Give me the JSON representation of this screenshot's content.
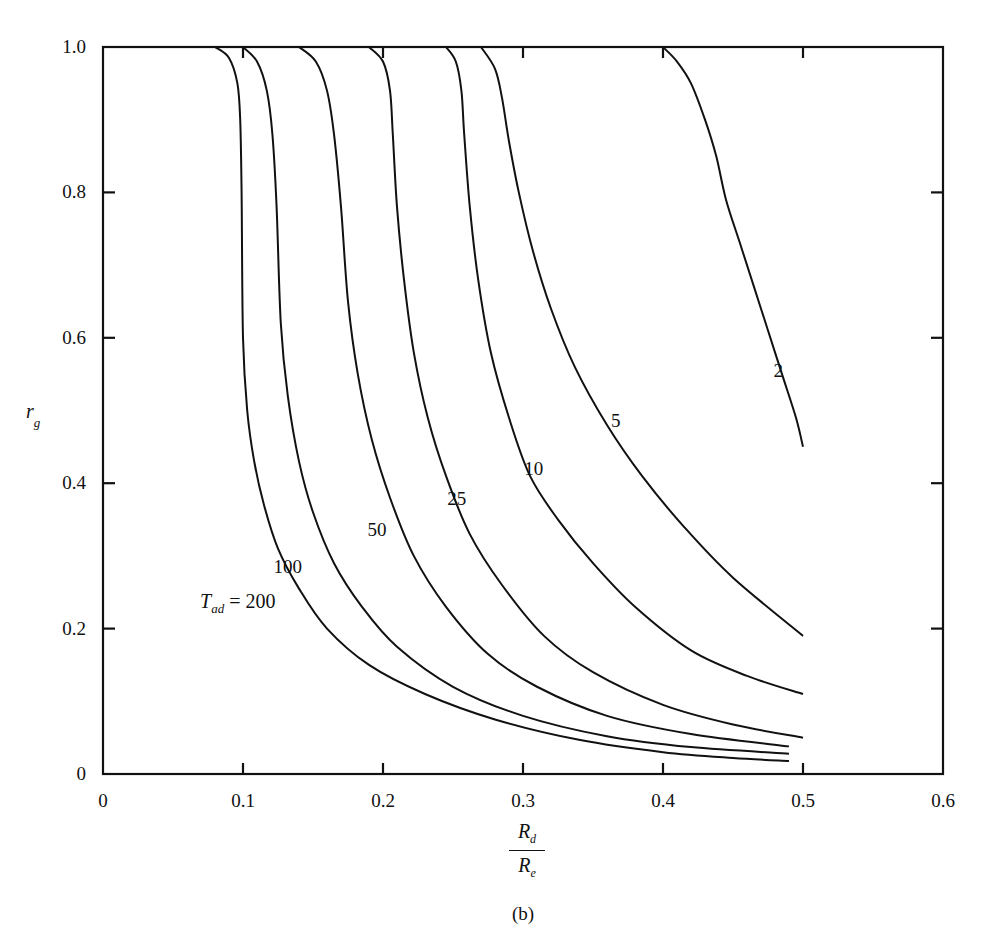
{
  "chart_data": {
    "type": "line",
    "title": "",
    "caption": "(b)",
    "xlabel": "R_d / R_e",
    "xlabel_num": "R",
    "xlabel_num_sub": "d",
    "xlabel_den": "R",
    "xlabel_den_sub": "e",
    "ylabel": "r_g",
    "ylabel_main": "r",
    "ylabel_sub": "g",
    "xlim": [
      0,
      0.6
    ],
    "ylim": [
      0,
      1.0
    ],
    "xticks": [
      "0",
      "0.1",
      "0.2",
      "0.3",
      "0.4",
      "0.5",
      "0.6"
    ],
    "yticks": [
      "0",
      "0.2",
      "0.4",
      "0.6",
      "0.8",
      "1.0"
    ],
    "grid": false,
    "legend": "inline curve labels",
    "parameter_name": "T_ad",
    "parameter_label_main": "T",
    "parameter_label_sub": "ad",
    "parameter_label_eq": " = 200",
    "series": [
      {
        "name": "200",
        "label": "200",
        "x": [
          0.08,
          0.09,
          0.096,
          0.098,
          0.099,
          0.1,
          0.103,
          0.108,
          0.115,
          0.125,
          0.14,
          0.16,
          0.19,
          0.23,
          0.28,
          0.34,
          0.4,
          0.45,
          0.49
        ],
        "y": [
          1.0,
          0.985,
          0.95,
          0.9,
          0.8,
          0.6,
          0.5,
          0.43,
          0.37,
          0.31,
          0.255,
          0.2,
          0.15,
          0.11,
          0.075,
          0.047,
          0.03,
          0.022,
          0.018
        ]
      },
      {
        "name": "100",
        "label": "100",
        "x": [
          0.1,
          0.11,
          0.117,
          0.121,
          0.124,
          0.127,
          0.132,
          0.14,
          0.15,
          0.165,
          0.185,
          0.21,
          0.25,
          0.3,
          0.36,
          0.42,
          0.49
        ],
        "y": [
          1.0,
          0.98,
          0.94,
          0.88,
          0.78,
          0.62,
          0.52,
          0.43,
          0.36,
          0.29,
          0.23,
          0.175,
          0.12,
          0.08,
          0.052,
          0.037,
          0.028
        ]
      },
      {
        "name": "50",
        "label": "50",
        "x": [
          0.14,
          0.152,
          0.16,
          0.165,
          0.17,
          0.175,
          0.182,
          0.192,
          0.205,
          0.222,
          0.245,
          0.275,
          0.31,
          0.36,
          0.42,
          0.49
        ],
        "y": [
          1.0,
          0.98,
          0.94,
          0.88,
          0.78,
          0.65,
          0.55,
          0.46,
          0.38,
          0.3,
          0.23,
          0.165,
          0.12,
          0.08,
          0.055,
          0.038
        ]
      },
      {
        "name": "25",
        "label": "25",
        "x": [
          0.19,
          0.2,
          0.205,
          0.207,
          0.21,
          0.215,
          0.222,
          0.232,
          0.245,
          0.262,
          0.285,
          0.315,
          0.35,
          0.4,
          0.45,
          0.5
        ],
        "y": [
          1.0,
          0.98,
          0.94,
          0.88,
          0.78,
          0.68,
          0.58,
          0.49,
          0.41,
          0.33,
          0.26,
          0.19,
          0.14,
          0.095,
          0.068,
          0.05
        ]
      },
      {
        "name": "10",
        "label": "10",
        "x": [
          0.245,
          0.252,
          0.256,
          0.258,
          0.262,
          0.268,
          0.277,
          0.29,
          0.305,
          0.325,
          0.35,
          0.38,
          0.42,
          0.46,
          0.5
        ],
        "y": [
          1.0,
          0.98,
          0.94,
          0.88,
          0.78,
          0.68,
          0.58,
          0.49,
          0.41,
          0.35,
          0.29,
          0.23,
          0.17,
          0.135,
          0.11
        ]
      },
      {
        "name": "5",
        "label": "5",
        "x": [
          0.27,
          0.28,
          0.285,
          0.29,
          0.297,
          0.307,
          0.32,
          0.337,
          0.36,
          0.385,
          0.415,
          0.45,
          0.5
        ],
        "y": [
          1.0,
          0.97,
          0.93,
          0.87,
          0.8,
          0.72,
          0.64,
          0.56,
          0.48,
          0.41,
          0.34,
          0.27,
          0.19
        ]
      },
      {
        "name": "2",
        "label": "2",
        "x": [
          0.4,
          0.41,
          0.42,
          0.43,
          0.438,
          0.445,
          0.455,
          0.465,
          0.475,
          0.485,
          0.495,
          0.5
        ],
        "y": [
          1.0,
          0.98,
          0.95,
          0.9,
          0.85,
          0.79,
          0.73,
          0.67,
          0.61,
          0.55,
          0.49,
          0.45
        ]
      }
    ],
    "label_positions": [
      {
        "text": "100",
        "x": 0.129,
        "y": 0.285
      },
      {
        "text": "50",
        "x": 0.196,
        "y": 0.335
      },
      {
        "text": "25",
        "x": 0.253,
        "y": 0.378
      },
      {
        "text": "10",
        "x": 0.308,
        "y": 0.42
      },
      {
        "text": "5",
        "x": 0.37,
        "y": 0.485
      },
      {
        "text": "2",
        "x": 0.486,
        "y": 0.555
      }
    ]
  }
}
